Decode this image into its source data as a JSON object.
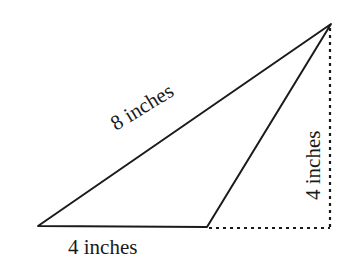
{
  "diagram": {
    "type": "obtuse triangle with height",
    "vertices": {
      "left": [
        38,
        226
      ],
      "bottom_right": [
        207,
        227
      ],
      "top": [
        331,
        24
      ]
    },
    "dashed_corner": [
      330,
      228
    ],
    "labels": {
      "hypotenuse": "8 inches",
      "base": "4 inches",
      "height": "4 inches"
    },
    "colors": {
      "stroke": "#1a1a1a",
      "background": "#ffffff"
    }
  }
}
